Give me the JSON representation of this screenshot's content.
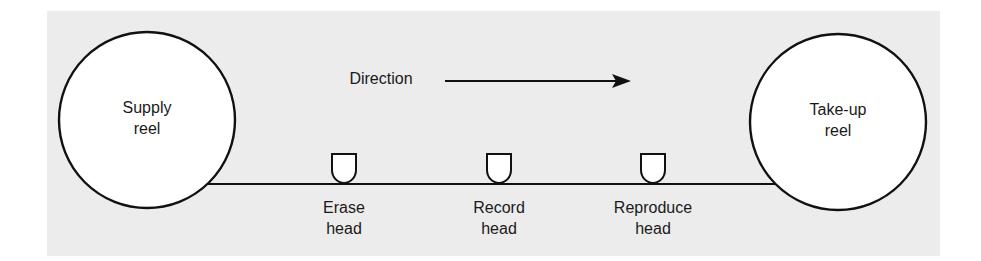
{
  "diagram": {
    "colors": {
      "background_panel": "#ececec",
      "stroke": "#111111",
      "fill": "#ffffff",
      "text": "#1a1a1a"
    },
    "direction_label": "Direction",
    "reels": [
      {
        "id": "supply",
        "line1": "Supply",
        "line2": "reel"
      },
      {
        "id": "takeup",
        "line1": "Take-up",
        "line2": "reel"
      }
    ],
    "heads": [
      {
        "id": "erase",
        "line1": "Erase",
        "line2": "head"
      },
      {
        "id": "record",
        "line1": "Record",
        "line2": "head"
      },
      {
        "id": "reproduce",
        "line1": "Reproduce",
        "line2": "head"
      }
    ]
  }
}
